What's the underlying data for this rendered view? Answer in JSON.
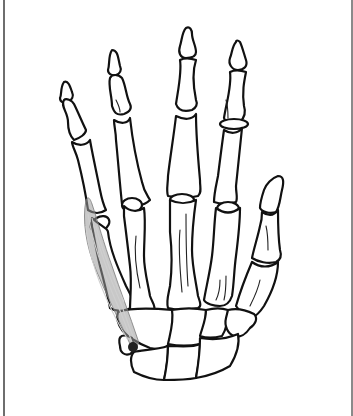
{
  "figure": {
    "highlighted_structure": "abductor digiti minimi",
    "origin_marker": "pisiform attachment point",
    "colors": {
      "background": "#ffffff",
      "bone_outline": "#111111",
      "muscle_fill": "#9a9a9a",
      "attachment_dot": "#222222",
      "frame_border": "#6e6e6e"
    }
  }
}
